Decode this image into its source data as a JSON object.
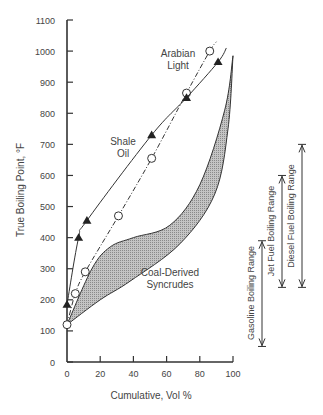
{
  "chart_data": {
    "type": "line",
    "title": "",
    "xlabel": "Cumulative, Vol %",
    "ylabel": "True Boiling Point, °F",
    "xlim": [
      0,
      100
    ],
    "ylim": [
      0,
      1100
    ],
    "xticks": [
      0,
      20,
      40,
      60,
      80,
      100
    ],
    "yticks": [
      0,
      100,
      200,
      300,
      400,
      500,
      600,
      700,
      800,
      900,
      1000,
      1100
    ],
    "grid": false,
    "series": [
      {
        "name": "Arabian Light",
        "marker": "open-circle",
        "line_style": "dash-dot",
        "x": [
          0,
          5,
          11,
          31,
          51,
          72,
          86
        ],
        "y": [
          120,
          220,
          290,
          470,
          655,
          865,
          1000
        ]
      },
      {
        "name": "Shale Oil",
        "marker": "filled-triangle",
        "line_style": "solid",
        "x": [
          0,
          7,
          12,
          51,
          72,
          91
        ],
        "y": [
          185,
          400,
          455,
          730,
          850,
          965
        ]
      }
    ],
    "bands": [
      {
        "name": "Coal-Derived Syncrudes",
        "fill": "#b5b5b5",
        "upper": {
          "x": [
            0,
            15,
            26,
            40,
            62,
            80,
            95,
            100
          ],
          "y": [
            120,
            300,
            370,
            400,
            440,
            570,
            810,
            985
          ]
        },
        "lower": {
          "x": [
            0,
            20,
            38,
            68,
            89,
            97,
            100
          ],
          "y": [
            120,
            200,
            260,
            380,
            540,
            750,
            985
          ]
        }
      }
    ],
    "ranges": [
      {
        "name": "Gasoline Boiling Range",
        "min": 50,
        "max": 390
      },
      {
        "name": "Jet Fuel Boiling Range",
        "min": 240,
        "max": 600
      },
      {
        "name": "Diesel Fuel Boiling Range",
        "min": 240,
        "max": 700
      }
    ],
    "annotations": [
      {
        "text": "Arabian Light",
        "lines": [
          "Arabian",
          "Light"
        ]
      },
      {
        "text": "Shale Oil",
        "lines": [
          "Shale",
          "Oil"
        ]
      },
      {
        "text": "Coal-Derived Syncrudes",
        "lines": [
          "Coal-Derived",
          "Syncrudes"
        ]
      }
    ]
  },
  "labels": {
    "xlabel": "Cumulative, Vol %",
    "ylabel": "True Boiling Point, °F",
    "arabian_1": "Arabian",
    "arabian_2": "Light",
    "shale_1": "Shale",
    "shale_2": "Oil",
    "coal_1": "Coal-Derived",
    "coal_2": "Syncrudes",
    "gasoline": "Gasoline Boiling Range",
    "jet": "Jet Fuel Boiling Range",
    "diesel": "Diesel Fuel Boiling Range"
  }
}
